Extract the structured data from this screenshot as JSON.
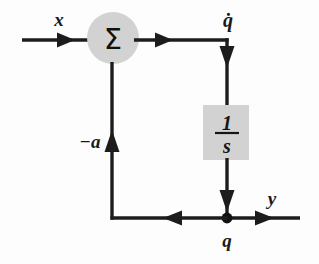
{
  "diagram": {
    "type": "control-system-block-diagram",
    "colors": {
      "line": "#1c1c1c",
      "block_fill": "#d2d2d2",
      "summing_fill": "#d2d2d2",
      "text": "#141414",
      "background": "#fdfdfd"
    },
    "labels": {
      "input": "x",
      "qdot": "q̇",
      "feedback_gain": "−a",
      "state": "q",
      "output": "y",
      "sigma": "Σ",
      "integrator_numerator": "1",
      "integrator_denominator": "s"
    },
    "nodes": {
      "summing_junction": {
        "name": "summing-junction",
        "glyph": "Σ",
        "cx": 113,
        "cy": 38,
        "r": 26,
        "fill": "#d2d2d2"
      },
      "integrator_block": {
        "name": "integrator-block",
        "expression": "1/s",
        "x": 203,
        "y": 105,
        "width": 46,
        "height": 55,
        "fill": "#d2d2d2"
      },
      "takeoff_point": {
        "name": "takeoff-node",
        "cx": 227,
        "cy": 218,
        "r": 5.2
      }
    },
    "signals": [
      {
        "name": "input-signal",
        "label": "x",
        "from": "input-terminal",
        "to": "summing-junction"
      },
      {
        "name": "qdot-signal",
        "label": "q̇",
        "from": "summing-junction",
        "to": "integrator-block"
      },
      {
        "name": "q-signal",
        "label": "q",
        "from": "integrator-block",
        "to": "takeoff-node"
      },
      {
        "name": "output-signal",
        "label": "y",
        "from": "takeoff-node",
        "to": "output-terminal"
      },
      {
        "name": "feedback-signal",
        "label": "−a",
        "from": "takeoff-node",
        "to": "summing-junction"
      }
    ]
  }
}
